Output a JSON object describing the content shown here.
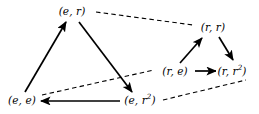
{
  "figure": {
    "type": "directed-graph-diagram",
    "background_color": "#ffffff",
    "stroke_color": "#000000",
    "width": 259,
    "height": 114
  },
  "nodes": [
    {
      "id": "e_r",
      "label_base": "(e, r",
      "label_sup": "",
      "label_tail": ")",
      "label_text": "(e, r)",
      "x": 72,
      "y": 11
    },
    {
      "id": "r_r",
      "label_base": "(r, r",
      "label_sup": "",
      "label_tail": ")",
      "label_text": "(r, r)",
      "x": 213,
      "y": 27
    },
    {
      "id": "r_e",
      "label_base": "(r, e",
      "label_sup": "",
      "label_tail": ")",
      "label_text": "(r, e)",
      "x": 175,
      "y": 71
    },
    {
      "id": "r_r2",
      "label_base": "(r, r",
      "label_sup": "2",
      "label_tail": ")",
      "label_text": "(r, r2)",
      "x": 232,
      "y": 71
    },
    {
      "id": "e_e",
      "label_base": "(e, e",
      "label_sup": "",
      "label_tail": ")",
      "label_text": "(e, e)",
      "x": 22,
      "y": 100
    },
    {
      "id": "e_r2",
      "label_base": "(e, r",
      "label_sup": "2",
      "label_tail": ")",
      "label_text": "(e, r2)",
      "x": 140,
      "y": 100
    }
  ],
  "edges_solid": [
    {
      "id": "edge-ee-to-er",
      "from": "e_e",
      "to": "e_r",
      "arrow": "forward"
    },
    {
      "id": "edge-er-to-er2",
      "from": "e_r",
      "to": "e_r2",
      "arrow": "forward"
    },
    {
      "id": "edge-er2-to-ee",
      "from": "e_r2",
      "to": "e_e",
      "arrow": "forward"
    },
    {
      "id": "edge-re-to-rr",
      "from": "r_e",
      "to": "r_r",
      "arrow": "forward"
    },
    {
      "id": "edge-rr-to-rr2",
      "from": "r_r",
      "to": "r_r2",
      "arrow": "forward"
    },
    {
      "id": "edge-re-to-rr2",
      "from": "r_e",
      "to": "r_r2",
      "arrow": "forward"
    }
  ],
  "edges_dashed": [
    {
      "id": "edge-er-dash-rr",
      "from": "e_r",
      "to": "r_r",
      "arrow": "none"
    },
    {
      "id": "edge-ee-dash-re",
      "from": "e_e",
      "to": "r_e",
      "arrow": "none"
    },
    {
      "id": "edge-er2-dash-rr2",
      "from": "e_r2",
      "to": "r_r2",
      "arrow": "none"
    }
  ]
}
